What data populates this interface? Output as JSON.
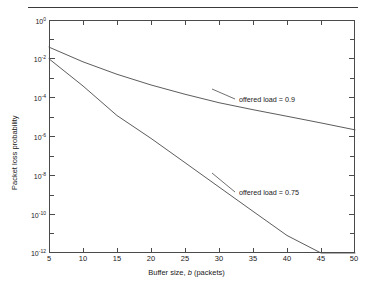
{
  "figure": {
    "has_top_rule": true,
    "background": "#ffffff",
    "line_color": "#4a4a4a",
    "text_color": "#1a1a1a"
  },
  "axes": {
    "x_title_prefix": "Buffer size, ",
    "x_title_italic": "b",
    "x_title_suffix": " (packets)",
    "y_title": "Packet loss probability",
    "x_tick_labels": [
      "5",
      "10",
      "15",
      "20",
      "25",
      "30",
      "35",
      "40",
      "45",
      "50"
    ],
    "y_tick_labels": [
      "10",
      "10",
      "10",
      "10",
      "10",
      "10",
      "10"
    ],
    "y_tick_exponents": [
      "0",
      "-2",
      "-4",
      "-6",
      "-8",
      "-10",
      "-12"
    ]
  },
  "annotations": {
    "upper": "offered load = 0.9",
    "lower": "offered load = 0.75"
  },
  "chart_data": {
    "type": "line",
    "title": "",
    "subtitle": "",
    "xlabel": "Buffer size, b (packets)",
    "ylabel": "Packet loss probability",
    "xlim": [
      5,
      50
    ],
    "ylim": [
      1e-12,
      1
    ],
    "yscale": "log",
    "xscale": "linear",
    "grid": false,
    "legend_position": "inline-annotation",
    "x_ticks": [
      5,
      10,
      15,
      20,
      25,
      30,
      35,
      40,
      45,
      50
    ],
    "y_ticks": [
      1,
      0.01,
      0.0001,
      1e-06,
      1e-08,
      1e-10,
      1e-12
    ],
    "y_tick_labels": [
      "10^0",
      "10^-2",
      "10^-4",
      "10^-6",
      "10^-8",
      "10^-10",
      "10^-12"
    ],
    "series": [
      {
        "name": "offered load = 0.9",
        "color": "#4a4a4a",
        "annotation": "offered load = 0.9",
        "x": [
          5,
          10,
          15,
          20,
          25,
          30,
          35,
          40,
          45,
          50
        ],
        "y": [
          0.04,
          0.007,
          0.0016,
          0.00045,
          0.00015,
          5.5e-05,
          2.4e-05,
          1.1e-05,
          5e-06,
          2.2e-06
        ]
      },
      {
        "name": "offered load = 0.75",
        "color": "#4a4a4a",
        "annotation": "offered load = 0.75",
        "x": [
          5,
          10,
          15,
          20,
          25,
          30,
          35,
          40,
          45,
          50
        ],
        "y": [
          0.01,
          0.0004,
          1.2e-05,
          8e-07,
          4.5e-08,
          2.5e-09,
          1.4e-10,
          8e-12,
          1e-12,
          1e-13
        ]
      }
    ]
  }
}
